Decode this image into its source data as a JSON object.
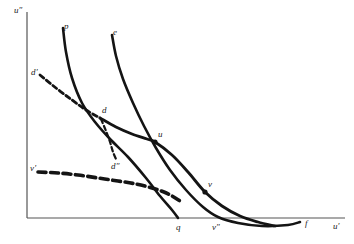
{
  "figure": {
    "kind": "line-diagram",
    "background_color": "#ffffff",
    "ink_color": "#141414",
    "axis_color": "#555555"
  },
  "axes": {
    "vertical_label": "u″",
    "horizontal_label": "u′",
    "origin_x": 27,
    "origin_y": 218,
    "vertical_top_y": 12,
    "horizontal_right_x": 345
  },
  "chart_data": {
    "type": "line",
    "title": "",
    "xlabel": "u′",
    "ylabel": "u″",
    "grid": false,
    "legend": "none",
    "series": [
      {
        "name": "p",
        "label": "p",
        "style": "solid",
        "width": 2.6,
        "points": [
          [
            63,
            28
          ],
          [
            66,
            52
          ],
          [
            72,
            78
          ],
          [
            82,
            103
          ],
          [
            95,
            122
          ],
          [
            110,
            139
          ],
          [
            128,
            157
          ],
          [
            146,
            178
          ],
          [
            160,
            196
          ],
          [
            172,
            210
          ],
          [
            178,
            218
          ]
        ]
      },
      {
        "name": "e",
        "label": "e",
        "style": "solid",
        "width": 2.6,
        "points": [
          [
            112,
            35
          ],
          [
            116,
            56
          ],
          [
            123,
            79
          ],
          [
            133,
            103
          ],
          [
            144,
            126
          ],
          [
            156,
            148
          ],
          [
            170,
            170
          ],
          [
            186,
            190
          ],
          [
            203,
            207
          ],
          [
            218,
            217
          ],
          [
            238,
            223
          ],
          [
            262,
            226
          ],
          [
            288,
            225
          ],
          [
            300,
            222
          ]
        ]
      },
      {
        "name": "d-prime-line",
        "label": "d′",
        "style": "dashed-then-solid",
        "width": 2.8,
        "dash_points": [
          [
            40,
            75
          ],
          [
            56,
            88
          ],
          [
            72,
            100
          ],
          [
            86,
            110
          ],
          [
            100,
            118
          ]
        ],
        "solid_points": [
          [
            100,
            118
          ],
          [
            116,
            127
          ],
          [
            132,
            134
          ],
          [
            147,
            139
          ],
          [
            155,
            142
          ],
          [
            172,
            155
          ],
          [
            188,
            172
          ],
          [
            205,
            192
          ],
          [
            222,
            206
          ],
          [
            240,
            216
          ],
          [
            258,
            222
          ],
          [
            275,
            226
          ]
        ]
      },
      {
        "name": "d-double-prime-branch",
        "label": "d″",
        "style": "dashed",
        "width": 2.2,
        "points": [
          [
            101,
            119
          ],
          [
            106,
            131
          ],
          [
            110,
            142
          ],
          [
            113,
            152
          ],
          [
            116,
            159
          ]
        ]
      },
      {
        "name": "v-prime",
        "label": "v′",
        "style": "dashed",
        "width": 3.6,
        "points": [
          [
            38,
            172
          ],
          [
            58,
            173
          ],
          [
            78,
            175
          ],
          [
            98,
            178
          ],
          [
            118,
            181
          ],
          [
            136,
            184
          ],
          [
            152,
            188
          ],
          [
            164,
            192
          ],
          [
            172,
            196
          ],
          [
            180,
            201
          ]
        ]
      }
    ],
    "curve_labels": [
      {
        "id": "p",
        "text": "p",
        "x": 64,
        "y": 22
      },
      {
        "id": "e",
        "text": "e",
        "x": 113,
        "y": 28
      },
      {
        "id": "dp",
        "text": "d′",
        "x": 31,
        "y": 68
      },
      {
        "id": "vp",
        "text": "v′",
        "x": 30,
        "y": 164
      },
      {
        "id": "dpp",
        "text": "d″",
        "x": 111,
        "y": 162
      },
      {
        "id": "f",
        "text": "f",
        "x": 305,
        "y": 219
      }
    ],
    "points": [
      {
        "id": "d",
        "label": "d",
        "x": 100,
        "y": 118,
        "label_dx": 2,
        "label_dy": -12,
        "marker": false
      },
      {
        "id": "u",
        "label": "u",
        "x": 155,
        "y": 142,
        "label_dx": 3,
        "label_dy": -12,
        "marker": true
      },
      {
        "id": "v",
        "label": "v",
        "x": 205,
        "y": 192,
        "label_dx": 3,
        "label_dy": -12,
        "marker": true
      },
      {
        "id": "q",
        "label": "q",
        "x": 178,
        "y": 218,
        "label_dx": -2,
        "label_dy": 5,
        "marker": false
      },
      {
        "id": "vpp",
        "label": "v″",
        "x": 215,
        "y": 218,
        "label_dx": -3,
        "label_dy": 5,
        "marker": false
      }
    ]
  }
}
